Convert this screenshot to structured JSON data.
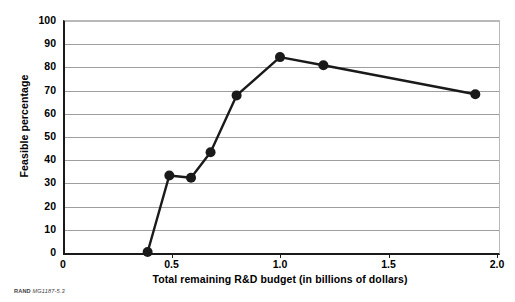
{
  "chart_data": {
    "type": "line",
    "title": "",
    "xlabel": "Total remaining R&D budget (in billions of dollars)",
    "ylabel": "Feasible percentage",
    "xlim": [
      0,
      2.0
    ],
    "ylim": [
      0,
      100
    ],
    "grid": true,
    "legend": "none",
    "marker": "filled-circle",
    "x": [
      0.39,
      0.49,
      0.59,
      0.68,
      0.8,
      1.0,
      1.2,
      1.9
    ],
    "values": [
      0,
      33,
      32,
      43,
      67.5,
      84,
      80.5,
      68
    ],
    "points": [
      {
        "x": 0.39,
        "y": 0
      },
      {
        "x": 0.49,
        "y": 33
      },
      {
        "x": 0.59,
        "y": 32
      },
      {
        "x": 0.68,
        "y": 43
      },
      {
        "x": 0.8,
        "y": 67.5
      },
      {
        "x": 1.0,
        "y": 84
      },
      {
        "x": 1.2,
        "y": 80.5
      },
      {
        "x": 1.9,
        "y": 68
      }
    ],
    "xticks": [
      0,
      0.5,
      1.0,
      1.5,
      2.0
    ],
    "xtick_labels": [
      "0",
      "0.5",
      "1.0",
      "1.5",
      "2.0"
    ],
    "yticks": [
      0,
      10,
      20,
      30,
      40,
      50,
      60,
      70,
      80,
      90,
      100
    ],
    "ytick_labels": [
      "0",
      "10",
      "20",
      "30",
      "40",
      "50",
      "60",
      "70",
      "80",
      "90",
      "100"
    ],
    "series_color": "#1a1a1a",
    "grid_color": "#9e9e9e",
    "axis_color": "#1a1a1a"
  },
  "caption": {
    "organization": "RAND",
    "reference": "MG1187-5.3"
  }
}
